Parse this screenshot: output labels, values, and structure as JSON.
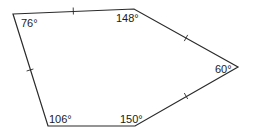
{
  "diagram": {
    "type": "pentagon",
    "stroke_color": "#2a2a2a",
    "vertices": [
      {
        "id": "A",
        "x": 13,
        "y": 14,
        "angle_label": "76°",
        "label_x": 21,
        "label_y": 27
      },
      {
        "id": "B",
        "x": 134,
        "y": 9,
        "angle_label": "148°",
        "label_x": 117,
        "label_y": 22
      },
      {
        "id": "C",
        "x": 238,
        "y": 67,
        "angle_label": "60°",
        "label_x": 215,
        "label_y": 74
      },
      {
        "id": "D",
        "x": 135,
        "y": 126,
        "angle_label": "150°",
        "label_x": 121,
        "label_y": 123
      },
      {
        "id": "E",
        "x": 48,
        "y": 126,
        "angle_label": "106°",
        "label_x": 49,
        "label_y": 123
      }
    ],
    "tick_marks": [
      {
        "side": "AB",
        "x": 73,
        "y": 11
      },
      {
        "side": "BC",
        "x": 186,
        "y": 38
      },
      {
        "side": "CD",
        "x": 186,
        "y": 96
      },
      {
        "side": "EA",
        "x": 30,
        "y": 70
      }
    ]
  }
}
